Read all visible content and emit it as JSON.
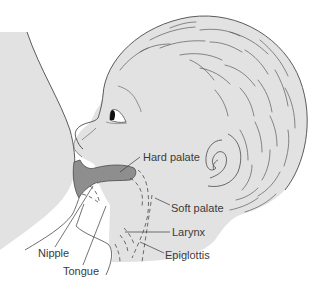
{
  "figure": {
    "colors": {
      "skin_fill": "#e2e2e2",
      "outline": "#4a4a4a",
      "oral_cavity_fill": "#8e8e8e",
      "label_text": "#3a3a3a",
      "background": "#ffffff"
    },
    "labels": [
      {
        "id": "hard-palate",
        "text": "Hard palate",
        "x": 143,
        "y": 152
      },
      {
        "id": "soft-palate",
        "text": "Soft palate",
        "x": 171,
        "y": 203
      },
      {
        "id": "larynx",
        "text": "Larynx",
        "x": 172,
        "y": 227
      },
      {
        "id": "epiglottis",
        "text": "Epiglottis",
        "x": 165,
        "y": 250
      },
      {
        "id": "nipple",
        "text": "Nipple",
        "x": 38,
        "y": 248
      },
      {
        "id": "tongue",
        "text": "Tongue",
        "x": 63,
        "y": 266
      }
    ]
  }
}
